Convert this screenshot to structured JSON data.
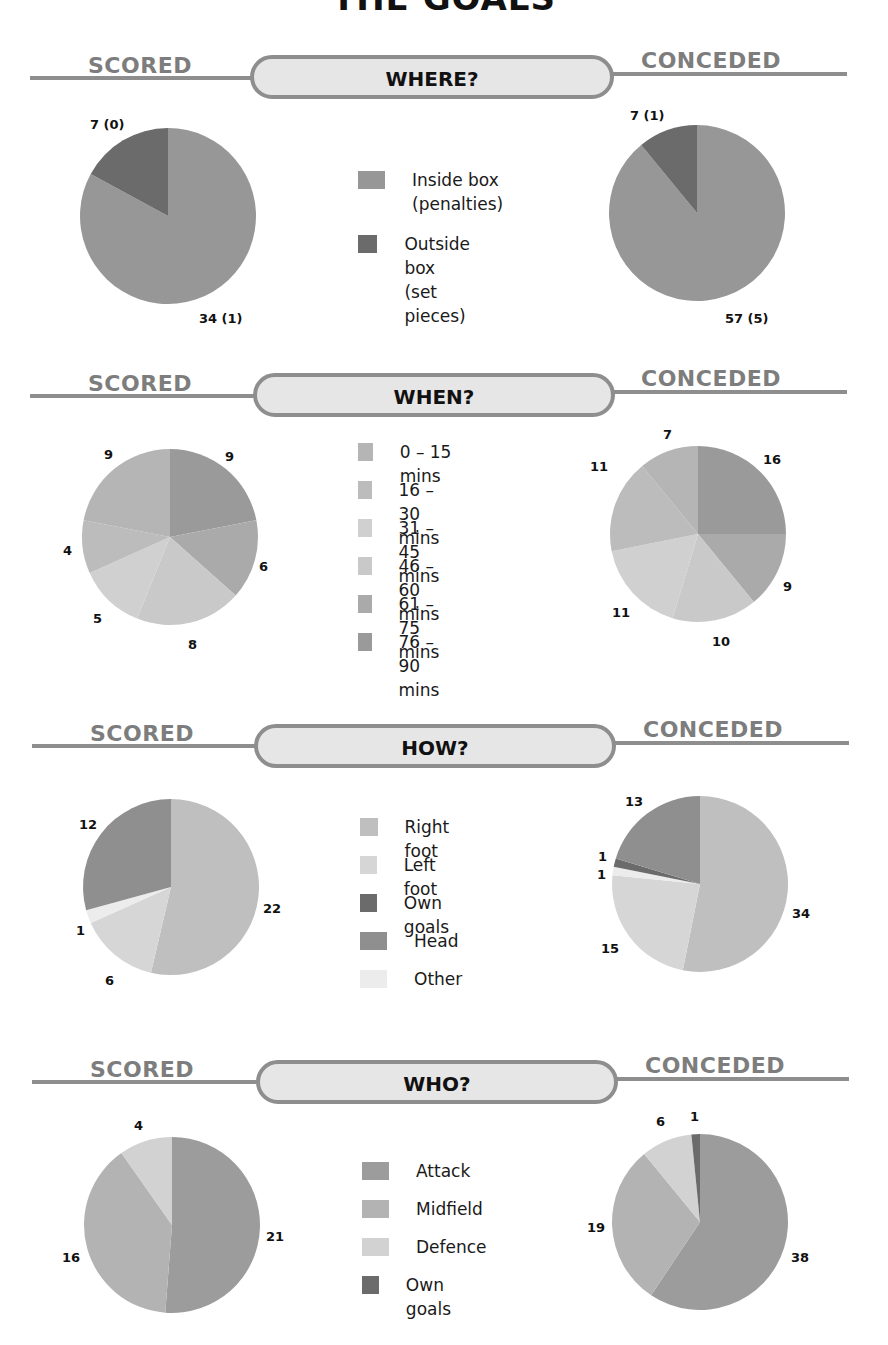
{
  "page": {
    "title": "THE GOALS",
    "scored_label": "SCORED",
    "conceded_label": "CONCEDED"
  },
  "colors": {
    "banner_line": "#8e8e8e",
    "banner_fill": "#e6e6e6",
    "side_label": "#7d7d7d"
  },
  "sections": [
    {
      "id": "where",
      "heading": "WHERE?",
      "legend": [
        {
          "label": "Inside box\n(penalties)",
          "color": "#979797"
        },
        {
          "label": "Outside box\n(set pieces)",
          "color": "#6b6b6b"
        }
      ],
      "scored": {
        "values": [
          34,
          7
        ],
        "colors": [
          "#979797",
          "#6b6b6b"
        ],
        "labels": [
          "34 (1)",
          "7 (0)"
        ]
      },
      "conceded": {
        "values": [
          57,
          7
        ],
        "colors": [
          "#979797",
          "#6b6b6b"
        ],
        "labels": [
          "57 (5)",
          "7 (1)"
        ]
      }
    },
    {
      "id": "when",
      "heading": "WHEN?",
      "legend": [
        {
          "label": "0 – 15 mins",
          "color": "#b5b5b5"
        },
        {
          "label": "16 – 30 mins",
          "color": "#bcbcbc"
        },
        {
          "label": "31 – 45 mins",
          "color": "#d0d0d0"
        },
        {
          "label": "46 – 60 mins",
          "color": "#c9c9c9"
        },
        {
          "label": "61 – 75 mins",
          "color": "#aaaaaa"
        },
        {
          "label": "76 – 90 mins",
          "color": "#9a9a9a"
        }
      ],
      "scored": {
        "values": [
          9,
          6,
          8,
          5,
          4,
          9
        ],
        "colors": [
          "#9a9a9a",
          "#aaaaaa",
          "#c9c9c9",
          "#d0d0d0",
          "#bcbcbc",
          "#b5b5b5"
        ],
        "labels": [
          "9",
          "6",
          "8",
          "5",
          "4",
          "9"
        ]
      },
      "conceded": {
        "values": [
          16,
          9,
          10,
          11,
          11,
          7
        ],
        "colors": [
          "#9a9a9a",
          "#aaaaaa",
          "#c9c9c9",
          "#d0d0d0",
          "#bcbcbc",
          "#b5b5b5"
        ],
        "labels": [
          "16",
          "9",
          "10",
          "11",
          "11",
          "7"
        ]
      }
    },
    {
      "id": "how",
      "heading": "HOW?",
      "legend": [
        {
          "label": "Right foot",
          "color": "#bfbfbf"
        },
        {
          "label": "Left foot",
          "color": "#d6d6d6"
        },
        {
          "label": "Own goals",
          "color": "#6b6b6b"
        },
        {
          "label": "Head",
          "color": "#8f8f8f"
        },
        {
          "label": "Other",
          "color": "#ececec"
        }
      ],
      "scored": {
        "values": [
          22,
          6,
          1,
          0,
          12
        ],
        "colors": [
          "#bfbfbf",
          "#d6d6d6",
          "#ececec",
          "#6b6b6b",
          "#8f8f8f"
        ],
        "labels": [
          "22",
          "6",
          "1",
          "",
          "12"
        ]
      },
      "conceded": {
        "values": [
          34,
          15,
          1,
          1,
          13
        ],
        "colors": [
          "#bfbfbf",
          "#d6d6d6",
          "#ececec",
          "#6b6b6b",
          "#8f8f8f"
        ],
        "labels": [
          "34",
          "15",
          "1",
          "1",
          "13"
        ]
      }
    },
    {
      "id": "who",
      "heading": "WHO?",
      "legend": [
        {
          "label": "Attack",
          "color": "#9c9c9c"
        },
        {
          "label": "Midfield",
          "color": "#b3b3b3"
        },
        {
          "label": "Defence",
          "color": "#d2d2d2"
        },
        {
          "label": "Own goals",
          "color": "#6b6b6b"
        }
      ],
      "scored": {
        "values": [
          21,
          16,
          4
        ],
        "colors": [
          "#9c9c9c",
          "#b3b3b3",
          "#d2d2d2"
        ],
        "labels": [
          "21",
          "16",
          "4"
        ]
      },
      "conceded": {
        "values": [
          38,
          19,
          6,
          1
        ],
        "colors": [
          "#9c9c9c",
          "#b3b3b3",
          "#d2d2d2",
          "#6b6b6b"
        ],
        "labels": [
          "38",
          "19",
          "6",
          "1"
        ]
      }
    }
  ],
  "chart_data": [
    {
      "type": "pie",
      "title": "WHERE? – Scored",
      "categories": [
        "Inside box (penalties)",
        "Outside box (set pieces)"
      ],
      "values": [
        34,
        7
      ],
      "annotations": {
        "Inside box (penalties)": "34 (1)",
        "Outside box (set pieces)": "7 (0)"
      },
      "legend_position": "center"
    },
    {
      "type": "pie",
      "title": "WHERE? – Conceded",
      "categories": [
        "Inside box (penalties)",
        "Outside box (set pieces)"
      ],
      "values": [
        57,
        7
      ],
      "annotations": {
        "Inside box (penalties)": "57 (5)",
        "Outside box (set pieces)": "7 (1)"
      },
      "legend_position": "center"
    },
    {
      "type": "pie",
      "title": "WHEN? – Scored",
      "categories": [
        "0 – 15 mins",
        "16 – 30 mins",
        "31 – 45 mins",
        "46 – 60 mins",
        "61 – 75 mins",
        "76 – 90 mins"
      ],
      "values": [
        9,
        4,
        5,
        8,
        6,
        9
      ],
      "legend_position": "center"
    },
    {
      "type": "pie",
      "title": "WHEN? – Conceded",
      "categories": [
        "0 – 15 mins",
        "16 – 30 mins",
        "31 – 45 mins",
        "46 – 60 mins",
        "61 – 75 mins",
        "76 – 90 mins"
      ],
      "values": [
        7,
        11,
        11,
        10,
        9,
        16
      ],
      "legend_position": "center"
    },
    {
      "type": "pie",
      "title": "HOW? – Scored",
      "categories": [
        "Right foot",
        "Left foot",
        "Own goals",
        "Head",
        "Other"
      ],
      "values": [
        22,
        6,
        0,
        12,
        1
      ],
      "legend_position": "center"
    },
    {
      "type": "pie",
      "title": "HOW? – Conceded",
      "categories": [
        "Right foot",
        "Left foot",
        "Own goals",
        "Head",
        "Other"
      ],
      "values": [
        34,
        15,
        1,
        13,
        1
      ],
      "legend_position": "center"
    },
    {
      "type": "pie",
      "title": "WHO? – Scored",
      "categories": [
        "Attack",
        "Midfield",
        "Defence",
        "Own goals"
      ],
      "values": [
        21,
        16,
        4,
        0
      ],
      "legend_position": "center"
    },
    {
      "type": "pie",
      "title": "WHO? – Conceded",
      "categories": [
        "Attack",
        "Midfield",
        "Defence",
        "Own goals"
      ],
      "values": [
        38,
        19,
        6,
        1
      ],
      "legend_position": "center"
    }
  ]
}
